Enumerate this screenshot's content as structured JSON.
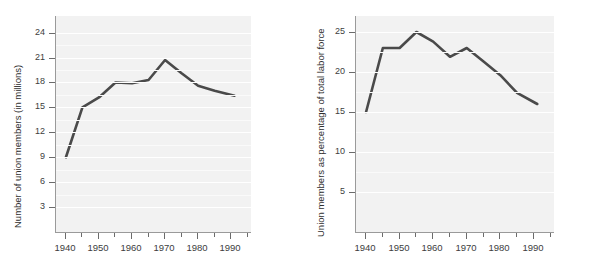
{
  "figure": {
    "background": "#ffffff",
    "plot_background": "#f2f2f2",
    "line_color": "#4a4a4a",
    "gridline_color": "#ffffff",
    "axis_color": "#9a9a9a"
  },
  "chart_data": [
    {
      "type": "line",
      "title": "",
      "xlabel": "",
      "ylabel": "Number of union members (in millions)",
      "x": [
        1940,
        1945,
        1950,
        1955,
        1960,
        1965,
        1970,
        1975,
        1980,
        1985,
        1991
      ],
      "values": [
        9.0,
        15.0,
        16.2,
        18.0,
        17.9,
        18.3,
        20.7,
        19.1,
        17.6,
        17.0,
        16.4
      ],
      "xlim": [
        1937,
        1996
      ],
      "ylim": [
        0,
        26
      ],
      "xticks": [
        1940,
        1945,
        1950,
        1955,
        1960,
        1965,
        1970,
        1975,
        1980,
        1985,
        1990,
        1995
      ],
      "xtick_labels": [
        "1940",
        "",
        "1950",
        "",
        "1960",
        "",
        "1970",
        "",
        "1980",
        "",
        "1990",
        ""
      ],
      "yticks": [
        3,
        6,
        9,
        12,
        15,
        18,
        21,
        24
      ],
      "ytick_labels": [
        "3",
        "6",
        "9",
        "12",
        "15",
        "18",
        "21",
        "24"
      ],
      "grid": true,
      "legend": "none"
    },
    {
      "type": "line",
      "title": "",
      "xlabel": "",
      "ylabel": "Union members as percentage of total labor force",
      "x": [
        1940,
        1945,
        1950,
        1955,
        1960,
        1965,
        1970,
        1975,
        1980,
        1985,
        1991
      ],
      "values": [
        15.0,
        23.0,
        23.0,
        25.0,
        23.8,
        21.9,
        23.0,
        21.3,
        19.6,
        17.4,
        16.0
      ],
      "xlim": [
        1937,
        1996
      ],
      "ylim": [
        0,
        27
      ],
      "xticks": [
        1940,
        1945,
        1950,
        1955,
        1960,
        1965,
        1970,
        1975,
        1980,
        1985,
        1990,
        1995
      ],
      "xtick_labels": [
        "1940",
        "",
        "1950",
        "",
        "1960",
        "",
        "1970",
        "",
        "1980",
        "",
        "1990",
        ""
      ],
      "yticks": [
        5,
        10,
        15,
        20,
        25
      ],
      "ytick_labels": [
        "5",
        "10",
        "15",
        "20",
        "25"
      ],
      "grid": true,
      "legend": "none"
    }
  ]
}
